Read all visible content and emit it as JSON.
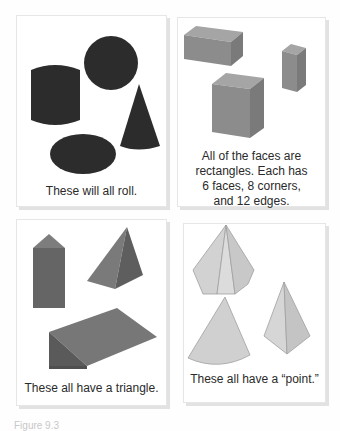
{
  "cards": [
    {
      "id": "roll",
      "caption": "These will all roll.",
      "shapes": [
        "cylinder",
        "sphere",
        "cone",
        "ellipsoid"
      ],
      "shape_color": "#2c2c2c"
    },
    {
      "id": "rectangular-prisms",
      "caption_lines": [
        "All of the faces are",
        "rectangles. Each has",
        "6 faces, 8 corners,",
        "and 12 edges."
      ],
      "shapes": [
        "rectangular-prism-wide",
        "rectangular-prism-tall-small",
        "rectangular-prism-tall"
      ],
      "shape_color": "#8a8a8a"
    },
    {
      "id": "triangle",
      "caption": "These all have a triangle.",
      "shapes": [
        "triangular-prism-upright",
        "square-pyramid",
        "triangular-prism-wedge"
      ],
      "shape_color": "#6b6b6b"
    },
    {
      "id": "point",
      "caption": "These all have a “point.”",
      "shapes": [
        "hexagonal-pyramid",
        "cone",
        "triangular-pyramid"
      ],
      "shape_color": "#c4c4c4"
    }
  ],
  "footer": {
    "text": "Figure 9.3"
  }
}
